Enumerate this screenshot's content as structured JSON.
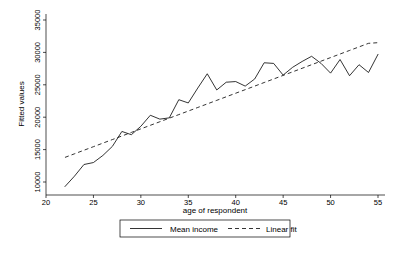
{
  "chart_data": {
    "type": "line",
    "title": "",
    "xlabel": "age of respondent",
    "ylabel": "Fitted values",
    "xlim": [
      20,
      55
    ],
    "ylim": [
      10000,
      35000
    ],
    "xticks": [
      20,
      25,
      30,
      35,
      40,
      45,
      50,
      55
    ],
    "yticks": [
      10000,
      15000,
      20000,
      25000,
      30000,
      35000
    ],
    "xtick_labels": [
      "20",
      "25",
      "30",
      "35",
      "40",
      "45",
      "50",
      "55"
    ],
    "ytick_labels": [
      "10000",
      "15000",
      "20000",
      "25000",
      "30000",
      "35000"
    ],
    "grid": false,
    "legend_position": "bottom-center",
    "x": [
      22,
      23,
      24,
      25,
      26,
      27,
      28,
      29,
      30,
      31,
      32,
      33,
      34,
      35,
      36,
      37,
      38,
      39,
      40,
      41,
      42,
      43,
      44,
      45,
      46,
      47,
      48,
      49,
      50,
      51,
      52,
      53,
      54,
      55
    ],
    "series": [
      {
        "name": "Mean income",
        "style": "solid",
        "color": "#000000",
        "values": [
          9300,
          10900,
          12700,
          13000,
          14100,
          15500,
          17800,
          17300,
          18600,
          20300,
          19700,
          19900,
          22700,
          22200,
          24500,
          26700,
          24200,
          25400,
          25500,
          24800,
          25900,
          28400,
          28300,
          26500,
          27700,
          28600,
          29400,
          28300,
          26800,
          28900,
          26400,
          28100,
          26900,
          29700
        ]
      },
      {
        "name": "Linear fit",
        "style": "dashed",
        "color": "#000000",
        "values": [
          13800,
          14350,
          14900,
          15450,
          16000,
          16550,
          17100,
          17650,
          18200,
          18750,
          19300,
          19850,
          20400,
          20950,
          21500,
          22050,
          22600,
          23150,
          23700,
          24250,
          24800,
          25350,
          25900,
          26450,
          27000,
          27550,
          28100,
          28650,
          29200,
          29750,
          30300,
          30850,
          31400,
          31500
        ]
      }
    ],
    "legend": [
      {
        "label": "Mean income",
        "style": "solid"
      },
      {
        "label": "Linear fit",
        "style": "dashed"
      }
    ]
  }
}
